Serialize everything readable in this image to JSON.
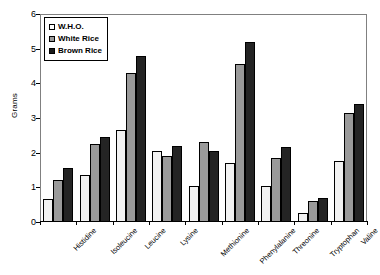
{
  "chart_data": {
    "type": "bar",
    "title": "",
    "xlabel": "",
    "ylabel": "Grams",
    "ylim": [
      0,
      6
    ],
    "yticks": [
      0,
      1,
      2,
      3,
      4,
      5,
      6
    ],
    "ytick_labels": [
      "0",
      "1",
      "2",
      "3",
      "4",
      "5",
      "6"
    ],
    "grid": false,
    "legend_position": "upper-left",
    "categories": [
      "Histidine",
      "Isoleucine",
      "Leucine",
      "Lysine",
      "Methionine",
      "Phenylalanine",
      "Threonine",
      "Tryptophan",
      "Valine"
    ],
    "series": [
      {
        "name": "W.H.O.",
        "color": "#f2f2f2",
        "values": [
          0.65,
          1.35,
          2.65,
          2.05,
          1.05,
          1.7,
          1.05,
          0.25,
          1.75
        ]
      },
      {
        "name": "White Rice",
        "color": "#9a9a9a",
        "values": [
          1.2,
          2.25,
          4.3,
          1.9,
          2.3,
          4.55,
          1.85,
          0.6,
          3.15
        ]
      },
      {
        "name": "Brown Rice",
        "color": "#242424",
        "values": [
          1.55,
          2.45,
          4.8,
          2.2,
          2.05,
          5.2,
          2.15,
          0.7,
          3.4
        ]
      }
    ]
  }
}
